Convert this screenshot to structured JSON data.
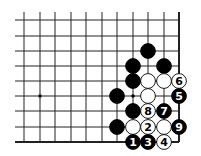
{
  "diagram": {
    "type": "go-board-diagram",
    "grid": {
      "columns_x": [
        24,
        40,
        55,
        71,
        86,
        102,
        117,
        133,
        148,
        164,
        179
      ],
      "rows_y": [
        20,
        36,
        51,
        66,
        81,
        96,
        111,
        127,
        142
      ],
      "left_extend": 15,
      "top_extend": 12,
      "right_edge": true,
      "bottom_edge": true,
      "line_color": "#222222"
    },
    "markers": [
      {
        "col": 1,
        "row": 5,
        "kind": "star-point"
      },
      {
        "col": 7,
        "row": 5,
        "kind": "star-point"
      }
    ],
    "stone_radius": 7.4,
    "stones": [
      {
        "col": 8,
        "row": 2,
        "color": "black",
        "label": ""
      },
      {
        "col": 7,
        "row": 3,
        "color": "black",
        "label": ""
      },
      {
        "col": 9,
        "row": 3,
        "color": "black",
        "label": ""
      },
      {
        "col": 7,
        "row": 4,
        "color": "black",
        "label": ""
      },
      {
        "col": 8,
        "row": 4,
        "color": "white",
        "label": ""
      },
      {
        "col": 9,
        "row": 4,
        "color": "white",
        "label": ""
      },
      {
        "col": 10,
        "row": 4,
        "color": "white",
        "label": "6"
      },
      {
        "col": 6,
        "row": 5,
        "color": "black",
        "label": ""
      },
      {
        "col": 8,
        "row": 5,
        "color": "white",
        "label": ""
      },
      {
        "col": 10,
        "row": 5,
        "color": "black",
        "label": "5"
      },
      {
        "col": 7,
        "row": 6,
        "color": "black",
        "label": ""
      },
      {
        "col": 8,
        "row": 6,
        "color": "white",
        "label": "8"
      },
      {
        "col": 9,
        "row": 6,
        "color": "black",
        "label": "7"
      },
      {
        "col": 6,
        "row": 7,
        "color": "black",
        "label": ""
      },
      {
        "col": 7,
        "row": 7,
        "color": "white",
        "label": ""
      },
      {
        "col": 8,
        "row": 7,
        "color": "white",
        "label": "2"
      },
      {
        "col": 9,
        "row": 7,
        "color": "white",
        "label": ""
      },
      {
        "col": 10,
        "row": 7,
        "color": "black",
        "label": "9"
      },
      {
        "col": 7,
        "row": 8,
        "color": "black",
        "label": "1"
      },
      {
        "col": 8,
        "row": 8,
        "color": "black",
        "label": "3"
      },
      {
        "col": 9,
        "row": 8,
        "color": "white",
        "label": "4"
      }
    ]
  }
}
